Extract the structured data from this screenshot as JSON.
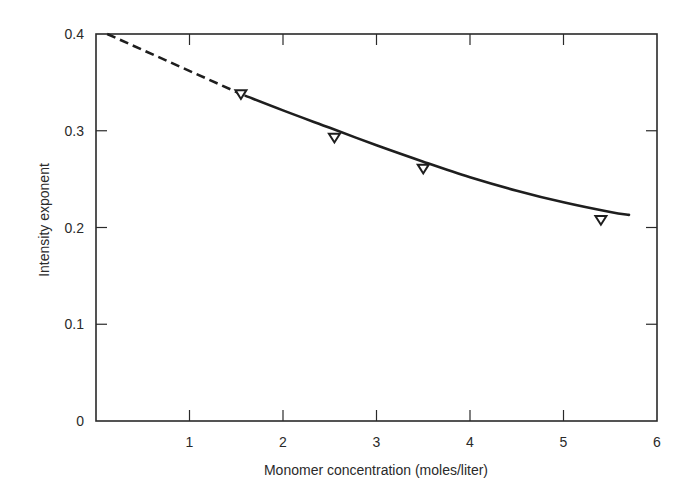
{
  "chart_data": {
    "type": "line",
    "title": "",
    "xlabel": "Monomer concentration (moles/liter)",
    "ylabel": "Intensity exponent",
    "xlim": [
      0,
      6
    ],
    "ylim": [
      0,
      0.4
    ],
    "grid": false,
    "legend": null,
    "x_ticks": [
      1,
      2,
      3,
      4,
      5,
      6
    ],
    "x_tick_labels": [
      "1",
      "2",
      "3",
      "4",
      "5",
      "6"
    ],
    "y_ticks": [
      0,
      0.1,
      0.2,
      0.3,
      0.4
    ],
    "y_tick_labels": [
      "0",
      "0.1",
      "0.2",
      "0.3",
      "0.4"
    ],
    "series": [
      {
        "name": "Measured data",
        "kind": "scatter",
        "marker": "inverted-triangle-open",
        "x": [
          1.55,
          2.55,
          3.5,
          5.4
        ],
        "y": [
          0.338,
          0.293,
          0.261,
          0.208
        ]
      },
      {
        "name": "Fitted curve (solid)",
        "kind": "line",
        "style": "solid",
        "x": [
          1.6,
          2.0,
          2.5,
          3.0,
          3.5,
          4.0,
          4.5,
          5.0,
          5.5,
          5.7
        ],
        "y": [
          0.336,
          0.321,
          0.303,
          0.285,
          0.268,
          0.252,
          0.238,
          0.226,
          0.216,
          0.213
        ]
      },
      {
        "name": "Extrapolation (dashed)",
        "kind": "line",
        "style": "dashed",
        "x": [
          0.12,
          1.55
        ],
        "y": [
          0.4,
          0.338
        ]
      }
    ]
  },
  "colors": {
    "background": "#ffffff",
    "ink": "#1e1e1e"
  }
}
